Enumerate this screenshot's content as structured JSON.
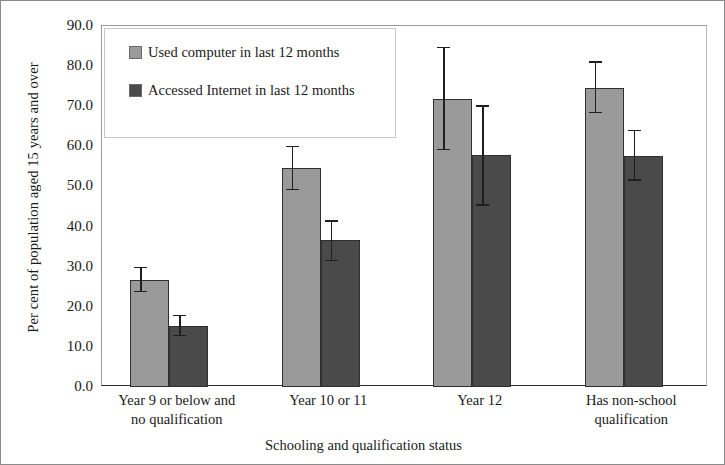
{
  "chart_data": {
    "type": "bar",
    "title": "",
    "xlabel": "Schooling and qualification status",
    "ylabel": "Per cent of population aged 15 years and over",
    "categories": [
      "Year 9 or below and no qualification",
      "Year 10 or 11",
      "Year 12",
      "Has non-school qualification"
    ],
    "category_lines": [
      [
        "Year 9 or below and",
        "no qualification"
      ],
      [
        "Year 10 or 11",
        ""
      ],
      [
        "Year 12",
        ""
      ],
      [
        "Has non-school",
        "qualification"
      ]
    ],
    "series": [
      {
        "name": "Used computer in last 12 months",
        "color": "#9a9a9a",
        "values": [
          26.7,
          54.6,
          71.8,
          74.6
        ],
        "error_low": [
          23.6,
          49.0,
          59.0,
          68.2
        ],
        "error_high": [
          30.0,
          60.2,
          84.8,
          81.2
        ]
      },
      {
        "name": "Accessed Internet in last 12 months",
        "color": "#4a4a4a",
        "values": [
          15.2,
          36.6,
          57.8,
          57.6
        ],
        "error_low": [
          12.6,
          31.4,
          45.2,
          51.4
        ],
        "error_high": [
          18.0,
          41.6,
          70.2,
          64.2
        ]
      }
    ],
    "ylim": [
      0,
      90
    ],
    "yticks": [
      0.0,
      10.0,
      20.0,
      30.0,
      40.0,
      50.0,
      60.0,
      70.0,
      80.0,
      90.0
    ],
    "ytick_labels": [
      "0.0",
      "10.0",
      "20.0",
      "30.0",
      "40.0",
      "50.0",
      "60.0",
      "70.0",
      "80.0",
      "90.0"
    ],
    "grid": false,
    "legend_position": "top-left",
    "error_bars": true
  },
  "legend": {
    "items": [
      {
        "label": "Used computer in last 12 months",
        "swatch": "light"
      },
      {
        "label": "Accessed Internet in last 12 months",
        "swatch": "dark"
      }
    ]
  }
}
